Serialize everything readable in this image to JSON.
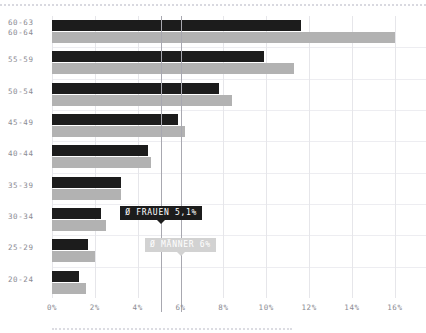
{
  "chart_data": {
    "type": "bar",
    "title": "",
    "subtitle": "",
    "xlabel": "",
    "ylabel": "",
    "orientation": "horizontal",
    "grid": true,
    "legend_position": "none",
    "xlim": [
      0,
      16.8
    ],
    "xticks": [
      0,
      2,
      4,
      6,
      8,
      10,
      12,
      14,
      16
    ],
    "xtick_labels": [
      "0%",
      "2%",
      "4%",
      "6%",
      "8%",
      "10%",
      "12%",
      "14%",
      "16%"
    ],
    "categories": [
      "20-24",
      "25-29",
      "30-34",
      "35-39",
      "40-44",
      "45-49",
      "50-54",
      "55-59",
      "60-63"
    ],
    "category_labels_top_row": [
      "60-63",
      "60-64"
    ],
    "series": [
      {
        "name": "FRAUEN",
        "color": "#1c1c1c",
        "values": [
          1.25,
          1.7,
          2.3,
          3.2,
          4.5,
          5.9,
          7.8,
          9.9,
          11.6
        ]
      },
      {
        "name": "MÄNNER",
        "color": "#b2b2b2",
        "values": [
          1.6,
          2.0,
          2.5,
          3.2,
          4.6,
          6.2,
          8.4,
          11.3,
          16.0
        ]
      }
    ],
    "reference_lines": [
      {
        "name": "frauen-average",
        "value": 5.1,
        "label": "Ø FRAUEN 5,1%",
        "style": "dark"
      },
      {
        "name": "maenner-average",
        "value": 6.0,
        "label": "Ø MÄNNER 6%",
        "style": "light"
      }
    ]
  },
  "colors": {
    "dark": "#1c1c1c",
    "light": "#b2b2b2",
    "badge_light": "#d2d2d2",
    "grid": "#e6e6ea",
    "refline": "#a8a8b0",
    "axis_text": "#8b8b93",
    "dotted_rule": "#d9d9e0"
  }
}
